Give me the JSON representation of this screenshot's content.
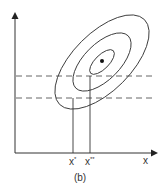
{
  "diagram": {
    "caption": "(b)",
    "x_axis_label": "x",
    "tick_labels": [
      {
        "id": "x_star",
        "base": "x",
        "sup": "*"
      },
      {
        "id": "x_double_star",
        "base": "x",
        "sup": "**"
      }
    ],
    "elements": {
      "contours": 3,
      "center_point": "optimum",
      "horizontal_dashed_lines": 2,
      "vertical_projection_lines": 2
    },
    "colors": {
      "stroke": "#333333",
      "dashed": "#666666",
      "background": "#ffffff"
    }
  }
}
